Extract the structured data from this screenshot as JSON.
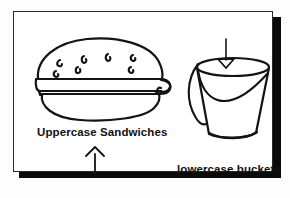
{
  "figure": {
    "background_color": "#fdfdfd",
    "ink_color": "#131313",
    "panel": {
      "border_color": "#2a2a2a",
      "fill_color": "#ffffff",
      "shadow_color": "#0a0a0a"
    }
  },
  "labels": {
    "sandwiches": "Uppercase Sandwiches",
    "buckets": "lowercase buckets"
  },
  "illustrations": {
    "burger": {
      "name": "hamburger",
      "parts": [
        "top-bun",
        "sesame-seeds",
        "cheese-slice",
        "cheese-corner-flap",
        "lettuce",
        "bottom-bun"
      ],
      "seed_count": 6
    },
    "bucket": {
      "name": "bucket",
      "parts": [
        "rim-ellipse",
        "tapered-body",
        "curved-base",
        "side-handle",
        "diagonal-line"
      ]
    }
  },
  "arrows": {
    "up": {
      "name": "arrow-up",
      "direction": "up",
      "head_style": "open-chevron",
      "points_to": "Uppercase Sandwiches"
    },
    "down": {
      "name": "arrow-down",
      "direction": "down",
      "head_style": "hollow-triangle",
      "points_to": "bucket"
    }
  }
}
